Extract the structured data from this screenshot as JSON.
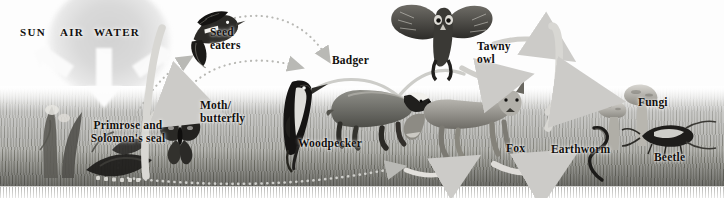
{
  "diagram": {
    "type": "food-web",
    "palette": {
      "background": "#ffffff",
      "grass_light": "#d8d8d6",
      "grass_dark": "#8a8a84",
      "arrow_grey": "#c9c9c6",
      "arrow_dotted": "#b4b4b0",
      "text": "#12100e",
      "sun_glow": "#d8d8d8"
    },
    "abiotic": {
      "sun_label": "SUN",
      "air_label": "AIR",
      "water_label": "WATER"
    },
    "organisms": [
      {
        "id": "primrose",
        "label": "Primrose and\nSolomon's seal",
        "role": "producer",
        "x": 75,
        "y": 120
      },
      {
        "id": "seed-eaters",
        "label": "Seed\neaters",
        "role": "consumer",
        "x": 214,
        "y": 32
      },
      {
        "id": "moth-butterfly",
        "label": "Moth/\nbutterfly",
        "role": "consumer",
        "x": 204,
        "y": 104
      },
      {
        "id": "woodpecker",
        "label": "Woodpecker",
        "role": "consumer",
        "x": 299,
        "y": 138
      },
      {
        "id": "badger",
        "label": "Badger",
        "role": "consumer",
        "x": 334,
        "y": 59
      },
      {
        "id": "tawny-owl",
        "label": "Tawny\nowl",
        "role": "predator",
        "x": 478,
        "y": 43
      },
      {
        "id": "fox",
        "label": "Fox",
        "role": "predator",
        "x": 508,
        "y": 142
      },
      {
        "id": "earthworm",
        "label": "Earthworm",
        "role": "decomposer",
        "x": 553,
        "y": 143
      },
      {
        "id": "fungi",
        "label": "Fungi",
        "role": "decomposer",
        "x": 639,
        "y": 98
      },
      {
        "id": "beetle",
        "label": "Beetle",
        "role": "decomposer",
        "x": 655,
        "y": 152
      }
    ],
    "arrows": [
      {
        "id": "sun-to-plants",
        "style": "white-solid",
        "from": "SUN",
        "to": "primrose"
      },
      {
        "id": "air-to-plants",
        "style": "white-solid",
        "from": "AIR",
        "to": "primrose"
      },
      {
        "id": "water-to-plants",
        "style": "white-solid",
        "from": "WATER",
        "to": "primrose"
      },
      {
        "id": "plants-to-moth",
        "style": "grey-solid",
        "from": "primrose",
        "to": "moth-butterfly"
      },
      {
        "id": "plants-to-seedeaters",
        "style": "grey-dotted",
        "from": "primrose",
        "to": "seed-eaters"
      },
      {
        "id": "seedeaters-to-badger",
        "style": "grey-dotted",
        "from": "seed-eaters",
        "to": "badger"
      },
      {
        "id": "moth-to-woodpecker",
        "style": "grey-dotted",
        "from": "moth-butterfly",
        "to": "woodpecker"
      },
      {
        "id": "woodpecker-to-badger",
        "style": "grey-solid",
        "from": "woodpecker",
        "to": "badger"
      },
      {
        "id": "badger-to-owl",
        "style": "grey-solid",
        "from": "badger",
        "to": "tawny-owl"
      },
      {
        "id": "owl-to-fox",
        "style": "grey-solid",
        "from": "tawny-owl",
        "to": "fox"
      },
      {
        "id": "owl-to-decomposers",
        "style": "grey-solid",
        "from": "tawny-owl",
        "to": "fungi"
      },
      {
        "id": "fox-to-decomposers",
        "style": "grey-solid",
        "from": "fox",
        "to": "earthworm"
      },
      {
        "id": "ground-to-fox",
        "style": "grey-dotted",
        "from": "primrose",
        "to": "fox"
      },
      {
        "id": "decomposers-to-plants",
        "style": "grey-solid",
        "from": "fungi",
        "to": "primrose"
      }
    ]
  }
}
